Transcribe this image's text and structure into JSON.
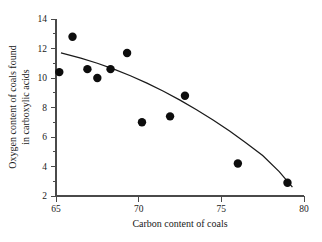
{
  "chart_data": {
    "type": "scatter",
    "title": "",
    "xlabel": "Carbon content of coals",
    "ylabel": "Oxygen content of coals found in carboxylic acids",
    "ylabel_line1": "Oxygen content of coals found",
    "ylabel_line2": "in carboxylic acids",
    "xlim": [
      65,
      80
    ],
    "ylim": [
      2,
      14
    ],
    "xticks": [
      65,
      70,
      75,
      80
    ],
    "yticks": [
      2,
      4,
      6,
      8,
      10,
      12,
      14
    ],
    "xtick_labels": [
      "65",
      "70",
      "75",
      "80"
    ],
    "ytick_labels": [
      "2",
      "4",
      "6",
      "8",
      "10",
      "12",
      "14"
    ],
    "x_minor_ticks": [],
    "y_minor_ticks": [
      3,
      5,
      7,
      9,
      11,
      13
    ],
    "grid": false,
    "legend": null,
    "x": [
      65.2,
      66.0,
      66.9,
      67.5,
      68.3,
      69.3,
      70.2,
      71.9,
      72.8,
      76.0,
      79.0
    ],
    "y": [
      10.4,
      12.8,
      10.6,
      10.0,
      10.6,
      11.7,
      7.0,
      7.4,
      8.8,
      4.2,
      2.9
    ],
    "points": [
      {
        "x": 65.2,
        "y": 10.4
      },
      {
        "x": 66.0,
        "y": 12.8
      },
      {
        "x": 66.9,
        "y": 10.6
      },
      {
        "x": 67.5,
        "y": 10.0
      },
      {
        "x": 68.3,
        "y": 10.6
      },
      {
        "x": 69.3,
        "y": 11.7
      },
      {
        "x": 70.2,
        "y": 7.0
      },
      {
        "x": 71.9,
        "y": 7.4
      },
      {
        "x": 72.8,
        "y": 8.8
      },
      {
        "x": 76.0,
        "y": 4.2
      },
      {
        "x": 79.0,
        "y": 2.9
      }
    ],
    "fit_curve": {
      "name": "fitted regression curve",
      "x": [
        65.3,
        66.5,
        67.5,
        68.5,
        69.5,
        70.5,
        71.5,
        72.5,
        73.5,
        74.5,
        75.5,
        76.5,
        77.5,
        78.5,
        79.3
      ],
      "y": [
        11.7,
        11.35,
        11.0,
        10.6,
        10.15,
        9.65,
        9.1,
        8.5,
        7.85,
        7.15,
        6.4,
        5.6,
        4.75,
        3.65,
        2.6
      ]
    },
    "marker": {
      "shape": "circle",
      "size": 4.2,
      "color": "#0d0d0d"
    },
    "colors": {
      "curve": "#1a1a1a",
      "axis": "#4a4a4a",
      "text": "#1a1a1a",
      "background": "#ffffff"
    }
  }
}
